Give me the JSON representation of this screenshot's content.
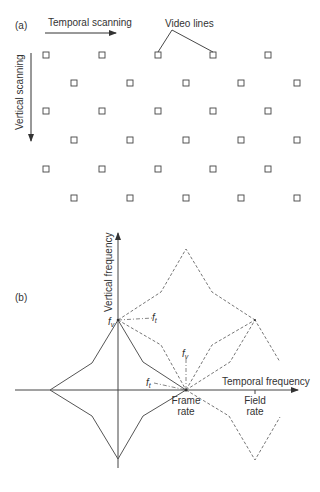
{
  "panel_a": {
    "label": "(a)",
    "temporal_scanning": "Temporal scanning",
    "vertical_scanning": "Vertical scanning",
    "video_lines": "Video lines",
    "grid": {
      "rows_y": [
        55,
        83,
        111,
        140,
        169,
        198
      ],
      "even_cols_x": [
        46,
        102,
        158,
        213,
        268
      ],
      "odd_cols_x": [
        74,
        130,
        186,
        241,
        297
      ]
    }
  },
  "panel_b": {
    "label": "(b)",
    "y_axis_label": "Vertical frequency",
    "x_axis_label": "Temporal frequency",
    "fv": "f",
    "fv_sub": "v",
    "ft": "f",
    "ft_sub": "t",
    "frame_rate_line1": "Frame",
    "frame_rate_line2": "rate",
    "field_rate_line1": "Field",
    "field_rate_line2": "rate"
  },
  "colors": {
    "line": "#555555",
    "text": "#333333"
  }
}
